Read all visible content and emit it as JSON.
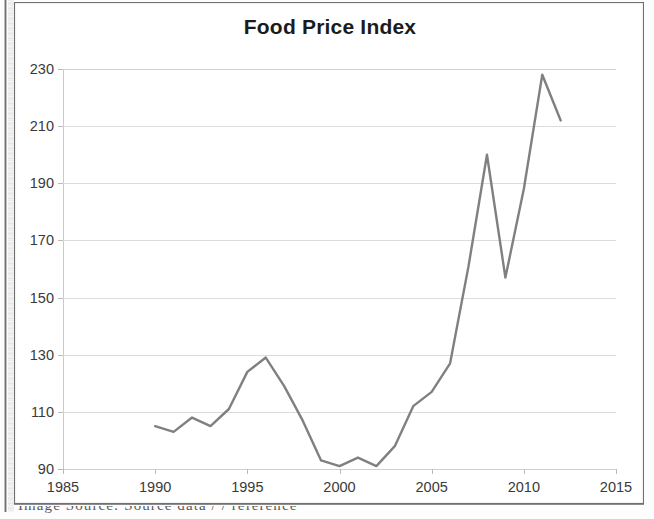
{
  "chart_data": {
    "type": "line",
    "title": "Food Price Index",
    "xlabel": "",
    "ylabel": "",
    "xlim": [
      1985,
      2015
    ],
    "ylim": [
      90,
      230
    ],
    "xticks": [
      1985,
      1990,
      1995,
      2000,
      2005,
      2010,
      2015
    ],
    "yticks": [
      90,
      110,
      130,
      150,
      170,
      190,
      210,
      230
    ],
    "grid": true,
    "legend": "none",
    "line_color": "#808080",
    "x": [
      1990,
      1991,
      1992,
      1993,
      1994,
      1995,
      1996,
      1997,
      1998,
      1999,
      2000,
      2001,
      2002,
      2003,
      2004,
      2005,
      2006,
      2007,
      2008,
      2009,
      2010,
      2011,
      2012
    ],
    "values": [
      105,
      103,
      108,
      105,
      111,
      124,
      129,
      119,
      107,
      93,
      91,
      94,
      91,
      98,
      112,
      117,
      127,
      161,
      200,
      157,
      188,
      228,
      212
    ],
    "series": [
      {
        "name": "Food Price Index",
        "values": [
          105,
          103,
          108,
          105,
          111,
          124,
          129,
          119,
          107,
          93,
          91,
          94,
          91,
          98,
          112,
          117,
          127,
          161,
          200,
          157,
          188,
          228,
          212
        ]
      }
    ]
  },
  "caption": {
    "cut_off_line": "Image Source: Source data / / reference"
  }
}
